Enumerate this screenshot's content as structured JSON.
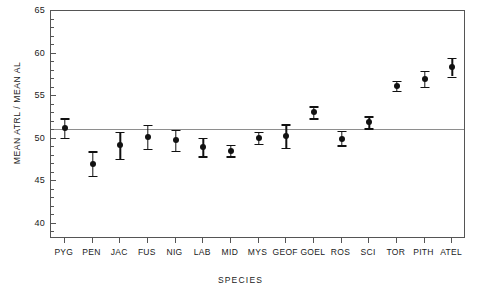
{
  "chart_data": {
    "type": "scatter",
    "title": "",
    "xlabel": "SPECIES",
    "ylabel": "MEAN ATRL / MEAN AL",
    "ylim": [
      38.2,
      65
    ],
    "ytick_values": [
      40,
      45,
      50,
      55,
      60,
      65
    ],
    "ytick_labels": [
      "40",
      "45",
      "50",
      "55",
      "60",
      "65"
    ],
    "yminor_step": 1,
    "grid": false,
    "legend": null,
    "reference_line": 51.1,
    "error_bar_type": "mean with error bars",
    "categories": [
      "PYG",
      "PEN",
      "JAC",
      "FUS",
      "NIG",
      "LAB",
      "MID",
      "MYS",
      "GEOF",
      "GOEL",
      "ROS",
      "SCI",
      "TOR",
      "PITH",
      "ATEL"
    ],
    "values": [
      51.2,
      47.0,
      49.2,
      50.2,
      49.8,
      49.0,
      48.6,
      50.1,
      50.3,
      53.1,
      50.0,
      51.9,
      56.2,
      57.0,
      58.4
    ],
    "errors_low": [
      50.1,
      45.6,
      47.6,
      48.8,
      48.6,
      47.9,
      47.9,
      49.4,
      48.9,
      52.4,
      49.2,
      51.2,
      55.6,
      56.1,
      57.3
    ],
    "errors_high": [
      52.4,
      48.5,
      50.8,
      51.6,
      51.0,
      50.1,
      49.3,
      50.8,
      51.7,
      53.8,
      50.9,
      52.6,
      56.8,
      58.0,
      59.5
    ]
  }
}
